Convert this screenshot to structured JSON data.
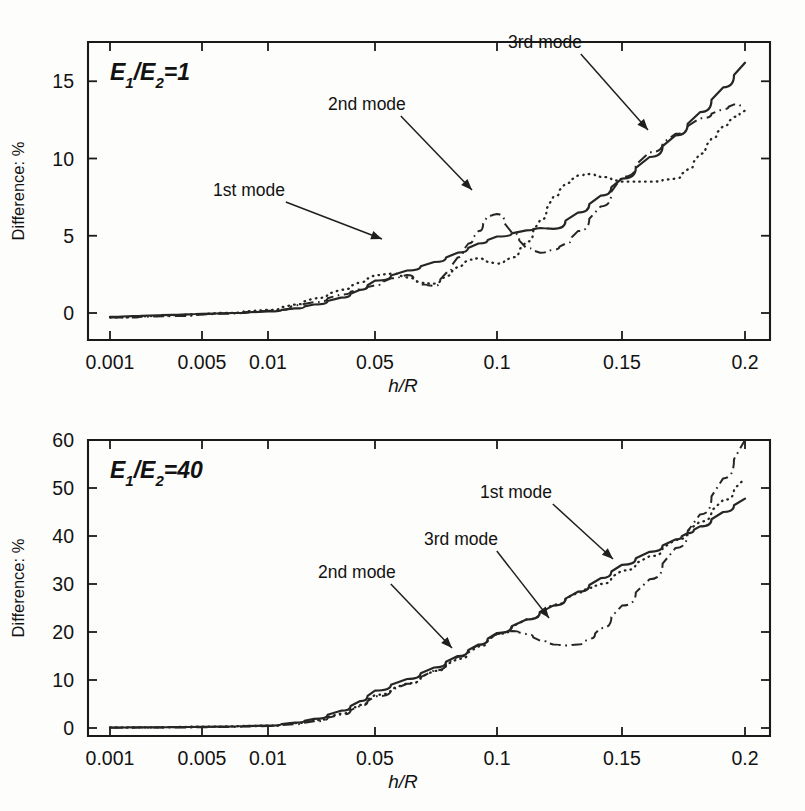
{
  "figure": {
    "background": "#fdfdfc",
    "ink": "#262626",
    "width": 805,
    "height": 811
  },
  "chart_data": [
    {
      "type": "line",
      "panel": "top",
      "title": "E1/E2=1",
      "title_parts": {
        "e": "E",
        "sub1": "1",
        "slash": "/",
        "e2": "E",
        "sub2": "2",
        "eq": "=1"
      },
      "xlabel": "h/R",
      "ylabel": "Difference: %",
      "xscale": "log-piecewise",
      "xticks": [
        0.001,
        0.005,
        0.01,
        0.05,
        0.1,
        0.15,
        0.2
      ],
      "xticklabels": [
        "0.001",
        "0.005",
        "0.01",
        "0.05",
        "0.1",
        "0.15",
        "0.2"
      ],
      "yticks": [
        0,
        5,
        10,
        15
      ],
      "yticklabels": [
        "0",
        "5",
        "10",
        "15"
      ],
      "ylim": [
        -1.4,
        17.6
      ],
      "xlim": [
        0.001,
        0.2
      ],
      "grid": false,
      "legend": "annotations",
      "annotations": [
        {
          "label": "1st mode",
          "target_series": "1st mode",
          "text_x": 213,
          "text_y": 196,
          "tip_x": 382,
          "tip_y": 239
        },
        {
          "label": "2nd mode",
          "target_series": "2nd mode",
          "text_x": 328,
          "text_y": 110,
          "tip_x": 472,
          "tip_y": 190
        },
        {
          "label": "3rd mode",
          "target_series": "3rd mode",
          "text_x": 508,
          "text_y": 48,
          "tip_x": 648,
          "tip_y": 130
        }
      ],
      "series": [
        {
          "name": "1st mode",
          "style": "solid",
          "points": [
            [
              0.001,
              -0.25
            ],
            [
              0.0015,
              -0.2
            ],
            [
              0.002,
              -0.16
            ],
            [
              0.003,
              -0.12
            ],
            [
              0.004,
              -0.09
            ],
            [
              0.005,
              -0.05
            ],
            [
              0.007,
              0.0
            ],
            [
              0.01,
              0.1
            ],
            [
              0.015,
              0.3
            ],
            [
              0.02,
              0.55
            ],
            [
              0.03,
              1.0
            ],
            [
              0.04,
              1.5
            ],
            [
              0.05,
              2.1
            ],
            [
              0.06,
              2.75
            ],
            [
              0.07,
              3.3
            ],
            [
              0.08,
              3.9
            ],
            [
              0.09,
              4.5
            ],
            [
              0.1,
              4.95
            ],
            [
              0.11,
              5.35
            ],
            [
              0.115,
              5.5
            ],
            [
              0.12,
              5.45
            ],
            [
              0.13,
              6.5
            ],
            [
              0.14,
              7.6
            ],
            [
              0.15,
              8.7
            ],
            [
              0.16,
              10.1
            ],
            [
              0.17,
              11.5
            ],
            [
              0.18,
              13.0
            ],
            [
              0.19,
              14.6
            ],
            [
              0.2,
              16.2
            ]
          ]
        },
        {
          "name": "2nd mode",
          "style": "dotted",
          "points": [
            [
              0.001,
              -0.3
            ],
            [
              0.002,
              -0.2
            ],
            [
              0.004,
              -0.1
            ],
            [
              0.006,
              0.0
            ],
            [
              0.01,
              0.2
            ],
            [
              0.015,
              0.55
            ],
            [
              0.02,
              0.95
            ],
            [
              0.03,
              1.5
            ],
            [
              0.04,
              2.0
            ],
            [
              0.05,
              2.45
            ],
            [
              0.055,
              2.55
            ],
            [
              0.06,
              2.3
            ],
            [
              0.065,
              1.95
            ],
            [
              0.07,
              1.9
            ],
            [
              0.075,
              2.4
            ],
            [
              0.08,
              3.0
            ],
            [
              0.085,
              3.45
            ],
            [
              0.09,
              3.55
            ],
            [
              0.095,
              3.3
            ],
            [
              0.1,
              3.2
            ],
            [
              0.105,
              3.6
            ],
            [
              0.11,
              4.6
            ],
            [
              0.115,
              6.0
            ],
            [
              0.12,
              7.5
            ],
            [
              0.125,
              8.4
            ],
            [
              0.13,
              8.9
            ],
            [
              0.135,
              9.0
            ],
            [
              0.14,
              8.8
            ],
            [
              0.15,
              8.5
            ],
            [
              0.16,
              8.5
            ],
            [
              0.17,
              8.7
            ],
            [
              0.175,
              9.3
            ],
            [
              0.18,
              10.3
            ],
            [
              0.185,
              11.3
            ],
            [
              0.19,
              12.1
            ],
            [
              0.195,
              12.7
            ],
            [
              0.2,
              13.1
            ]
          ]
        },
        {
          "name": "3rd mode",
          "style": "dashdot",
          "points": [
            [
              0.001,
              -0.3
            ],
            [
              0.003,
              -0.2
            ],
            [
              0.006,
              -0.05
            ],
            [
              0.01,
              0.15
            ],
            [
              0.02,
              0.7
            ],
            [
              0.03,
              1.2
            ],
            [
              0.04,
              1.55
            ],
            [
              0.05,
              1.8
            ],
            [
              0.055,
              2.25
            ],
            [
              0.06,
              2.45
            ],
            [
              0.065,
              1.85
            ],
            [
              0.07,
              1.75
            ],
            [
              0.075,
              2.6
            ],
            [
              0.08,
              3.6
            ],
            [
              0.085,
              4.5
            ],
            [
              0.09,
              5.3
            ],
            [
              0.095,
              6.3
            ],
            [
              0.1,
              6.4
            ],
            [
              0.105,
              5.2
            ],
            [
              0.11,
              4.2
            ],
            [
              0.115,
              3.9
            ],
            [
              0.12,
              4.1
            ],
            [
              0.125,
              4.5
            ],
            [
              0.13,
              5.3
            ],
            [
              0.14,
              6.9
            ],
            [
              0.15,
              8.8
            ],
            [
              0.16,
              10.4
            ],
            [
              0.17,
              11.6
            ],
            [
              0.18,
              12.6
            ],
            [
              0.19,
              13.2
            ],
            [
              0.195,
              13.5
            ],
            [
              0.2,
              13.4
            ]
          ]
        }
      ]
    },
    {
      "type": "line",
      "panel": "bottom",
      "title": "E1/E2=40",
      "title_parts": {
        "e": "E",
        "sub1": "1",
        "slash": "/",
        "e2": "E",
        "sub2": "2",
        "eq": "=40"
      },
      "xlabel": "h/R",
      "ylabel": "Difference: %",
      "xscale": "log-piecewise",
      "xticks": [
        0.001,
        0.005,
        0.01,
        0.05,
        0.1,
        0.15,
        0.2
      ],
      "xticklabels": [
        "0.001",
        "0.005",
        "0.01",
        "0.05",
        "0.1",
        "0.15",
        "0.2"
      ],
      "yticks": [
        0,
        10,
        20,
        30,
        40,
        50,
        60
      ],
      "yticklabels": [
        "0",
        "10",
        "20",
        "30",
        "40",
        "50",
        "60"
      ],
      "ylim": [
        -4.5,
        64
      ],
      "xlim": [
        0.001,
        0.2
      ],
      "grid": false,
      "legend": "annotations",
      "annotations": [
        {
          "label": "1st mode",
          "target_series": "1st mode",
          "text_x": 480,
          "text_y": 498,
          "tip_x": 613,
          "tip_y": 559
        },
        {
          "label": "2nd mode",
          "target_series": "2nd mode",
          "text_x": 318,
          "text_y": 578,
          "tip_x": 452,
          "tip_y": 648
        },
        {
          "label": "3rd mode",
          "target_series": "3rd mode",
          "text_x": 424,
          "text_y": 545,
          "tip_x": 549,
          "tip_y": 618
        }
      ],
      "series": [
        {
          "name": "1st mode",
          "style": "solid",
          "points": [
            [
              0.001,
              0.1
            ],
            [
              0.002,
              0.15
            ],
            [
              0.004,
              0.2
            ],
            [
              0.006,
              0.3
            ],
            [
              0.01,
              0.5
            ],
            [
              0.015,
              1.1
            ],
            [
              0.02,
              1.9
            ],
            [
              0.03,
              3.6
            ],
            [
              0.04,
              5.6
            ],
            [
              0.05,
              7.8
            ],
            [
              0.06,
              10.2
            ],
            [
              0.07,
              12.6
            ],
            [
              0.08,
              15.0
            ],
            [
              0.09,
              17.4
            ],
            [
              0.1,
              19.8
            ],
            [
              0.11,
              22.6
            ],
            [
              0.12,
              25.5
            ],
            [
              0.13,
              28.4
            ],
            [
              0.14,
              31.2
            ],
            [
              0.15,
              34.0
            ],
            [
              0.16,
              36.7
            ],
            [
              0.17,
              39.3
            ],
            [
              0.175,
              40.6
            ],
            [
              0.18,
              42.0
            ],
            [
              0.19,
              45.0
            ],
            [
              0.2,
              47.8
            ]
          ]
        },
        {
          "name": "2nd mode",
          "style": "dotted",
          "points": [
            [
              0.001,
              0.1
            ],
            [
              0.002,
              0.15
            ],
            [
              0.005,
              0.3
            ],
            [
              0.01,
              0.5
            ],
            [
              0.015,
              1.0
            ],
            [
              0.02,
              1.6
            ],
            [
              0.03,
              3.0
            ],
            [
              0.04,
              4.8
            ],
            [
              0.05,
              6.9
            ],
            [
              0.06,
              9.3
            ],
            [
              0.07,
              11.9
            ],
            [
              0.08,
              14.4
            ],
            [
              0.09,
              17.0
            ],
            [
              0.1,
              19.6
            ],
            [
              0.11,
              22.6
            ],
            [
              0.12,
              25.7
            ],
            [
              0.13,
              28.2
            ],
            [
              0.135,
              29.2
            ],
            [
              0.14,
              30.0
            ],
            [
              0.15,
              32.8
            ],
            [
              0.16,
              35.8
            ],
            [
              0.17,
              39.2
            ],
            [
              0.18,
              43.0
            ],
            [
              0.19,
              47.5
            ],
            [
              0.2,
              52.0
            ]
          ]
        },
        {
          "name": "3rd mode",
          "style": "dashdot",
          "points": [
            [
              0.001,
              0.05
            ],
            [
              0.003,
              0.1
            ],
            [
              0.006,
              0.2
            ],
            [
              0.01,
              0.4
            ],
            [
              0.015,
              0.8
            ],
            [
              0.02,
              1.4
            ],
            [
              0.03,
              2.8
            ],
            [
              0.04,
              4.6
            ],
            [
              0.05,
              6.6
            ],
            [
              0.06,
              9.2
            ],
            [
              0.07,
              12.0
            ],
            [
              0.08,
              14.8
            ],
            [
              0.09,
              17.3
            ],
            [
              0.1,
              19.6
            ],
            [
              0.105,
              20.2
            ],
            [
              0.11,
              19.6
            ],
            [
              0.115,
              18.2
            ],
            [
              0.12,
              17.4
            ],
            [
              0.125,
              17.2
            ],
            [
              0.13,
              17.4
            ],
            [
              0.135,
              18.6
            ],
            [
              0.14,
              20.8
            ],
            [
              0.15,
              25.5
            ],
            [
              0.16,
              31.0
            ],
            [
              0.17,
              37.5
            ],
            [
              0.18,
              44.5
            ],
            [
              0.19,
              52.0
            ],
            [
              0.2,
              60.0
            ]
          ]
        }
      ]
    }
  ]
}
